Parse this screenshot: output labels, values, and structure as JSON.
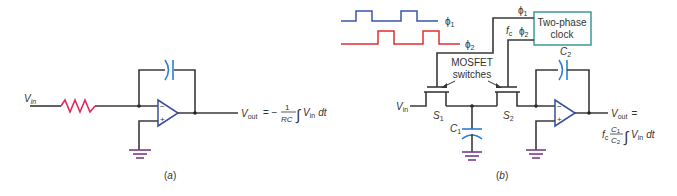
{
  "colors": {
    "wire": "#3a3a3a",
    "resistor": "#e0285a",
    "capacitor": "#2f7fd0",
    "opamp": "#3a4f9a",
    "ground": "#7a3a8a",
    "phi1_wave": "#3b55a8",
    "phi2_wave": "#e03030",
    "clock_box": "#3a9a9a"
  },
  "panel_a": {
    "caption": "(a)",
    "vin_label": "V",
    "vin_sub": "in",
    "vout_label": "V",
    "vout_sub": "out",
    "formula_eq": "= −",
    "formula_num": "1",
    "formula_den": "RC",
    "formula_integral": "∫",
    "formula_tail_v": "V",
    "formula_tail_sub": "in",
    "formula_tail_dt": "dt",
    "opamp_minus": "−",
    "opamp_plus": "+"
  },
  "panel_b": {
    "caption": "(b)",
    "phi1_label": "ϕ",
    "phi1_sub": "1",
    "phi2_label": "ϕ",
    "phi2_sub": "2",
    "clock_box_line1": "Two-phase",
    "clock_box_line2": "clock",
    "fc_label": "f",
    "fc_sub": "c",
    "mosfet_label_line1": "MOSFET",
    "mosfet_label_line2": "switches",
    "s1_label": "S",
    "s1_sub": "1",
    "s2_label": "S",
    "s2_sub": "2",
    "c1_label": "C",
    "c1_sub": "1",
    "c2_label": "C",
    "c2_sub": "2",
    "vin_label": "V",
    "vin_sub": "in",
    "vout_label": "V",
    "vout_sub": "out",
    "vout_eq": "=",
    "formula_fc": "f",
    "formula_fc_sub": "c",
    "formula_num": "C",
    "formula_num_sub": "1",
    "formula_den": "C",
    "formula_den_sub": "2",
    "formula_integral": "∫",
    "formula_tail_v": "V",
    "formula_tail_sub": "in",
    "formula_tail_dt": "dt",
    "opamp_minus": "−",
    "opamp_plus": "+"
  }
}
